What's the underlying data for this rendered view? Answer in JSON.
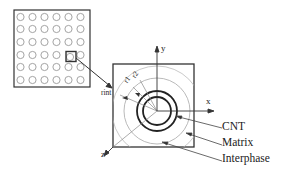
{
  "diagram": {
    "grid": {
      "rows": 6,
      "cols": 6,
      "highlight_row": 3,
      "highlight_col": 4
    },
    "axes": {
      "x": "x",
      "y": "y",
      "z": "z"
    },
    "radii_labels": [
      "r1",
      "r2",
      "rint"
    ],
    "legend": [
      {
        "label": "CNT"
      },
      {
        "label": "Matrix"
      },
      {
        "label": "Interphase"
      }
    ],
    "colors": {
      "stroke": "#333333",
      "grid_circle": "#9a9a9a",
      "thin_circle": "#a8a8a8",
      "background": "#ffffff"
    }
  }
}
